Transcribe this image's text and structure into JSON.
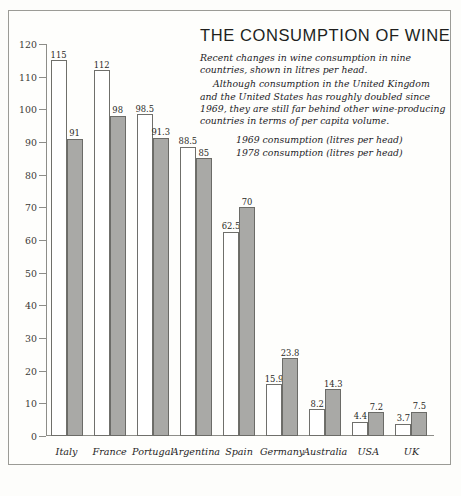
{
  "chart_data": {
    "type": "bar",
    "title": "THE CONSUMPTION OF WINE",
    "xlabel": "",
    "ylabel": "",
    "ylim": [
      0,
      120
    ],
    "ytick_step": 10,
    "yticks": [
      0,
      10,
      20,
      30,
      40,
      50,
      60,
      70,
      80,
      90,
      100,
      110,
      120
    ],
    "grid": false,
    "legend_position": "top-right",
    "categories": [
      "Italy",
      "France",
      "Portugal",
      "Argentina",
      "Spain",
      "Germany",
      "Australia",
      "USA",
      "UK"
    ],
    "series": [
      {
        "name": "1969 consumption (litres per head)",
        "values": [
          115,
          112,
          98.5,
          88.5,
          62.5,
          15.9,
          8.2,
          4.4,
          3.7
        ],
        "labels": [
          "115",
          "112",
          "98.5",
          "88.5",
          "62.5",
          "15.9",
          "8.2",
          "4.4",
          "3.7"
        ],
        "style": "open"
      },
      {
        "name": "1978 consumption (litres per head)",
        "values": [
          91,
          98,
          91.3,
          85,
          70,
          23.8,
          14.3,
          7.2,
          7.5
        ],
        "labels": [
          "91",
          "98",
          "91.3",
          "85",
          "70",
          "23.8",
          "14.3",
          "7.2",
          "7.5"
        ],
        "style": "filled"
      }
    ],
    "annotations": [
      "Recent changes in wine consumption in nine countries, shown in litres per head.",
      "Although consumption in the United Kingdom and the United States has roughly doubled since 1969, they are still far behind other wine-producing countries in terms of per capita volume."
    ]
  },
  "header": {
    "title": "THE CONSUMPTION OF WINE",
    "paragraph1": "Recent changes in wine consumption in nine countries, shown in litres per head.",
    "paragraph2": "Although consumption in the United Kingdom and the United States has roughly doubled since 1969, they are still far behind other wine-producing countries in terms of per capita volume."
  },
  "legend": {
    "items": [
      "1969 consumption (litres per head)",
      "1978 consumption (litres per head)"
    ]
  },
  "colors": {
    "open_bar_fill": "#ffffff",
    "filled_bar_fill": "#a9a9a6",
    "bar_outline": "#6f6f6b",
    "axis": "#8d8d88",
    "frame": "#9b9b96",
    "text": "#23221f",
    "background": "#fdfdfb"
  }
}
